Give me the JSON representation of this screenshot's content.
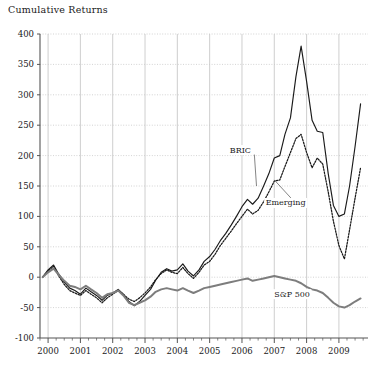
{
  "chart_data": {
    "type": "line",
    "title": "Cumulative Returns",
    "xlabel": "",
    "ylabel": "",
    "xlim": [
      1999.75,
      2009.9
    ],
    "ylim": [
      -100,
      400
    ],
    "ytick_labels": [
      "400",
      "350",
      "300",
      "250",
      "200",
      "150",
      "100",
      "50",
      "0",
      "-50",
      "-100"
    ],
    "yticks": [
      400,
      350,
      300,
      250,
      200,
      150,
      100,
      50,
      0,
      -50,
      -100
    ],
    "xtick_labels": [
      "2000",
      "2001",
      "2002",
      "2003",
      "2004",
      "2005",
      "2006",
      "2007",
      "2008",
      "2009"
    ],
    "xticks": [
      2000,
      2001,
      2002,
      2003,
      2004,
      2005,
      2006,
      2007,
      2008,
      2009
    ],
    "minor_ticks_per_year": 4,
    "grid": "horizontal dotted, vertical solid light gray",
    "legend_position": "inline annotations",
    "colors": {
      "bric": "#1a1a1a",
      "emerging": "#1a1a1a",
      "sp500": "#7d7d7d",
      "grid": "#c8c8c8",
      "axis": "#555555",
      "background": "#ffffff"
    },
    "annotations": [
      {
        "label": "BRIC",
        "x": 2005.95,
        "y": 205,
        "leader_to_x": 2006.45,
        "leader_to_y": 150
      },
      {
        "label": "Emerging",
        "x": 2007.35,
        "y": 118,
        "leader_to_x": 2007.0,
        "leader_to_y": 160
      },
      {
        "label": "S&P 500",
        "x": 2007.55,
        "y": -32,
        "leader_to_x": 2007.55,
        "leader_to_y": -32
      }
    ],
    "series": [
      {
        "name": "BRIC",
        "style": "solid",
        "x": [
          1999.83,
          2000.0,
          2000.17,
          2000.33,
          2000.5,
          2000.67,
          2000.83,
          2001.0,
          2001.17,
          2001.33,
          2001.5,
          2001.67,
          2001.83,
          2002.0,
          2002.17,
          2002.33,
          2002.5,
          2002.67,
          2002.83,
          2003.0,
          2003.17,
          2003.33,
          2003.5,
          2003.67,
          2003.83,
          2004.0,
          2004.17,
          2004.33,
          2004.5,
          2004.67,
          2004.83,
          2005.0,
          2005.17,
          2005.33,
          2005.5,
          2005.67,
          2005.83,
          2006.0,
          2006.17,
          2006.33,
          2006.5,
          2006.67,
          2006.83,
          2007.0,
          2007.17,
          2007.33,
          2007.5,
          2007.67,
          2007.83,
          2008.0,
          2008.17,
          2008.33,
          2008.5,
          2008.67,
          2008.83,
          2009.0,
          2009.17,
          2009.33,
          2009.5,
          2009.67
        ],
        "y": [
          0,
          12,
          20,
          5,
          -8,
          -18,
          -22,
          -28,
          -18,
          -24,
          -30,
          -38,
          -30,
          -26,
          -20,
          -28,
          -40,
          -47,
          -40,
          -30,
          -20,
          -5,
          8,
          14,
          10,
          12,
          22,
          10,
          2,
          12,
          26,
          34,
          46,
          60,
          72,
          86,
          100,
          116,
          128,
          120,
          130,
          150,
          170,
          196,
          200,
          235,
          262,
          330,
          380,
          322,
          258,
          240,
          238,
          170,
          118,
          100,
          104,
          150,
          215,
          285
        ]
      },
      {
        "name": "Emerging",
        "style": "dotted",
        "x": [
          1999.83,
          2000.0,
          2000.17,
          2000.33,
          2000.5,
          2000.67,
          2000.83,
          2001.0,
          2001.17,
          2001.33,
          2001.5,
          2001.67,
          2001.83,
          2002.0,
          2002.17,
          2002.33,
          2002.5,
          2002.67,
          2002.83,
          2003.0,
          2003.17,
          2003.33,
          2003.5,
          2003.67,
          2003.83,
          2004.0,
          2004.17,
          2004.33,
          2004.5,
          2004.67,
          2004.83,
          2005.0,
          2005.17,
          2005.33,
          2005.5,
          2005.67,
          2005.83,
          2006.0,
          2006.17,
          2006.33,
          2006.5,
          2006.67,
          2006.83,
          2007.0,
          2007.17,
          2007.33,
          2007.5,
          2007.67,
          2007.83,
          2008.0,
          2008.17,
          2008.33,
          2008.5,
          2008.67,
          2008.83,
          2009.0,
          2009.17,
          2009.33,
          2009.5,
          2009.67
        ],
        "y": [
          0,
          10,
          18,
          2,
          -12,
          -22,
          -26,
          -30,
          -22,
          -28,
          -34,
          -42,
          -34,
          -28,
          -22,
          -28,
          -36,
          -40,
          -34,
          -26,
          -16,
          -4,
          6,
          12,
          8,
          6,
          16,
          6,
          -2,
          8,
          20,
          26,
          38,
          52,
          64,
          76,
          88,
          100,
          112,
          104,
          110,
          124,
          140,
          158,
          160,
          182,
          205,
          228,
          235,
          205,
          180,
          196,
          186,
          140,
          92,
          52,
          30,
          78,
          130,
          180
        ]
      },
      {
        "name": "S&P 500",
        "style": "solid-thick",
        "x": [
          1999.83,
          2000.0,
          2000.17,
          2000.33,
          2000.5,
          2000.67,
          2000.83,
          2001.0,
          2001.17,
          2001.33,
          2001.5,
          2001.67,
          2001.83,
          2002.0,
          2002.17,
          2002.33,
          2002.5,
          2002.67,
          2002.83,
          2003.0,
          2003.17,
          2003.33,
          2003.5,
          2003.67,
          2003.83,
          2004.0,
          2004.17,
          2004.33,
          2004.5,
          2004.67,
          2004.83,
          2005.0,
          2005.17,
          2005.33,
          2005.5,
          2005.67,
          2005.83,
          2006.0,
          2006.17,
          2006.33,
          2006.5,
          2006.67,
          2006.83,
          2007.0,
          2007.17,
          2007.33,
          2007.5,
          2007.67,
          2007.83,
          2008.0,
          2008.17,
          2008.33,
          2008.5,
          2008.67,
          2008.83,
          2009.0,
          2009.17,
          2009.33,
          2009.5,
          2009.67
        ],
        "y": [
          0,
          8,
          14,
          4,
          -6,
          -14,
          -16,
          -20,
          -14,
          -20,
          -26,
          -34,
          -28,
          -26,
          -22,
          -30,
          -42,
          -46,
          -42,
          -38,
          -32,
          -24,
          -20,
          -18,
          -20,
          -22,
          -18,
          -22,
          -26,
          -22,
          -18,
          -16,
          -14,
          -12,
          -10,
          -8,
          -6,
          -4,
          -2,
          -6,
          -4,
          -2,
          0,
          2,
          0,
          -2,
          -4,
          -6,
          -10,
          -16,
          -20,
          -22,
          -26,
          -34,
          -42,
          -48,
          -50,
          -46,
          -40,
          -35
        ]
      }
    ]
  }
}
